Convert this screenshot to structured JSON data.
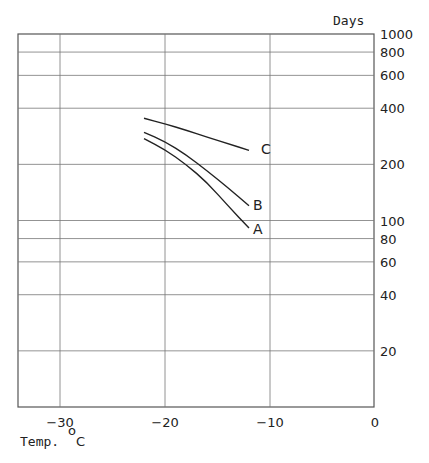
{
  "chart_data": {
    "type": "line",
    "title": "",
    "xlabel": "Temp. °C",
    "ylabel": "Days",
    "xlim": [
      -34,
      0
    ],
    "ylim": [
      10,
      1000
    ],
    "yscale": "log",
    "grid": true,
    "x_ticks": [
      -30,
      -20,
      -10,
      0
    ],
    "x_tick_labels": [
      "−30",
      "−20",
      "−10",
      "0"
    ],
    "y_ticks": [
      1000,
      800,
      600,
      400,
      200,
      100,
      80,
      60,
      40,
      20
    ],
    "y_tick_labels": [
      "1000",
      "800",
      "600",
      "400",
      "200",
      "100",
      "80",
      "60",
      "40",
      "20"
    ],
    "legend": "inline labels at curve ends",
    "series": [
      {
        "name": "A",
        "x": [
          -22,
          -20,
          -18,
          -16,
          -14,
          -12
        ],
        "values": [
          275,
          240,
          200,
          160,
          120,
          91
        ]
      },
      {
        "name": "B",
        "x": [
          -22,
          -20,
          -18,
          -16,
          -14,
          -12
        ],
        "values": [
          297,
          265,
          225,
          185,
          150,
          120
        ]
      },
      {
        "name": "C",
        "x": [
          -22,
          -20,
          -18,
          -16,
          -14,
          -12
        ],
        "values": [
          353,
          330,
          305,
          280,
          258,
          238
        ]
      }
    ]
  },
  "axis": {
    "y_title": "Days",
    "x_title": "Temp.",
    "x_unit_deg": "o",
    "x_unit": "C"
  }
}
